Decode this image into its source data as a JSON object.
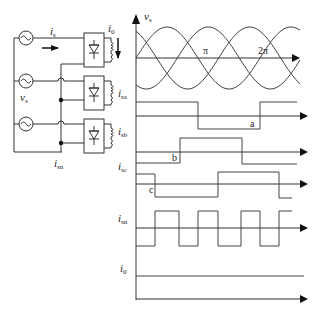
{
  "circuit": {
    "source_current_label": {
      "main": "i",
      "sub": "s"
    },
    "load_current_label": {
      "main": "i",
      "sub": "0"
    },
    "source_voltage_label": {
      "main": "v",
      "sub": "s"
    },
    "neutral_current_label": {
      "main": "i",
      "sub": "sn"
    },
    "phases": 3
  },
  "waveforms": {
    "vs": {
      "label_main": "v",
      "label_sub": "s",
      "tick_pi": "π",
      "tick_2pi": "2π"
    },
    "isa": {
      "label_main": "i",
      "label_sub": "sa",
      "marker": "a"
    },
    "isb": {
      "label_main": "i",
      "label_sub": "sb",
      "marker": "b"
    },
    "isc": {
      "label_main": "i",
      "label_sub": "sc",
      "marker": "c"
    },
    "isn": {
      "label_main": "i",
      "label_sub": "sn"
    },
    "i0": {
      "label_main": "i",
      "label_sub": "0"
    }
  },
  "colors": {
    "line": "#333333",
    "background": "#ffffff"
  }
}
